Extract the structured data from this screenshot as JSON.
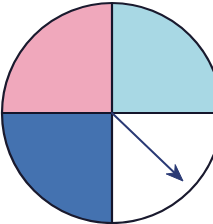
{
  "figure": {
    "background_color": "#FFFFFF",
    "width": 213,
    "height": 224
  },
  "chart_data": {
    "type": "pie",
    "title": "",
    "subtitle": "",
    "xlabel": "",
    "ylabel": "",
    "grid": false,
    "legend_position": "none",
    "center": {
      "x": 112,
      "y": 113
    },
    "radius": 110,
    "outline_color": "#1A1A2E",
    "outline_width": 2.2,
    "divider_color": "#15152B",
    "divider_width": 2.2,
    "categories": [
      "Top-left quadrant",
      "Top-right quadrant",
      "Bottom-left quadrant",
      "Bottom-right quadrant"
    ],
    "values": [
      25,
      25,
      25,
      25
    ],
    "value_unit": "percent",
    "slices": [
      {
        "name": "Top-left quadrant",
        "value": 25,
        "start_angle_deg": 90,
        "end_angle_deg": 180,
        "fill": "#F0A8BC",
        "fill_name": "pink",
        "filled": true
      },
      {
        "name": "Top-right quadrant",
        "value": 25,
        "start_angle_deg": 0,
        "end_angle_deg": 90,
        "fill": "#A8D8E4",
        "fill_name": "light-cyan",
        "filled": true
      },
      {
        "name": "Bottom-left quadrant",
        "value": 25,
        "start_angle_deg": 180,
        "end_angle_deg": 270,
        "fill": "#4472B0",
        "fill_name": "medium-blue",
        "filled": true
      },
      {
        "name": "Bottom-right quadrant",
        "value": 25,
        "start_angle_deg": 270,
        "end_angle_deg": 360,
        "fill": "#FFFFFF",
        "fill_name": "white",
        "filled": false
      }
    ],
    "annotations": [
      {
        "type": "arrow",
        "name": "radius-arrow",
        "from": {
          "x": 112,
          "y": 113
        },
        "to": {
          "x": 183,
          "y": 181
        },
        "angle_deg_below_horizontal": 44,
        "color": "#2A3A75",
        "line_width": 2,
        "head_length": 17,
        "head_width": 13,
        "label": ""
      }
    ]
  }
}
